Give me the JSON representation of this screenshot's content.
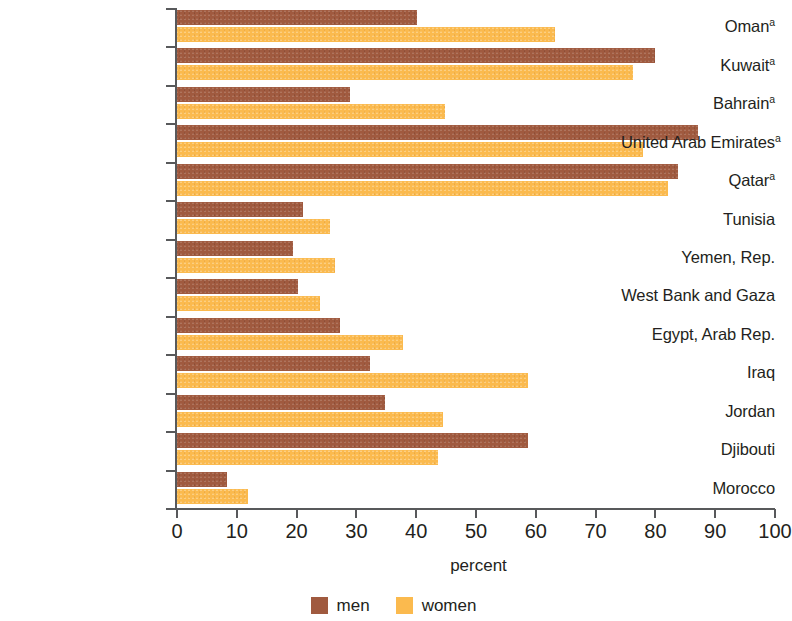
{
  "chart_data": {
    "type": "bar",
    "orientation": "horizontal",
    "title": "",
    "xlabel": "percent",
    "ylabel": "",
    "xlim": [
      0,
      100
    ],
    "xticks": [
      0,
      10,
      20,
      30,
      40,
      50,
      60,
      70,
      80,
      90,
      100
    ],
    "grid": false,
    "legend_position": "bottom-center",
    "categories": [
      "Oman",
      "Kuwait",
      "Bahrain",
      "United Arab Emirates",
      "Qatar",
      "Tunisia",
      "Yemen, Rep.",
      "West Bank and Gaza",
      "Egypt, Arab Rep.",
      "Iraq",
      "Jordan",
      "Djibouti",
      "Morocco"
    ],
    "category_footnotes": [
      "a",
      "a",
      "a",
      "a",
      "a",
      "",
      "",
      "",
      "",
      "",
      "",
      "",
      ""
    ],
    "series": [
      {
        "name": "men",
        "color": "#a05a3f",
        "values": [
          40.3,
          80.1,
          29.1,
          87.3,
          83.9,
          21.2,
          19.6,
          20.4,
          27.4,
          32.4,
          35.0,
          58.9,
          8.5
        ]
      },
      {
        "name": "women",
        "color": "#fbba4e",
        "values": [
          63.4,
          76.4,
          45.0,
          78.1,
          82.3,
          25.8,
          26.6,
          24.1,
          38.0,
          58.9,
          44.6,
          43.8,
          12.0
        ]
      }
    ]
  },
  "colors": {
    "men": "#a05a3f",
    "women": "#fbba4e",
    "axis": "#58595b",
    "text": "#231f20",
    "background": "#ffffff"
  }
}
